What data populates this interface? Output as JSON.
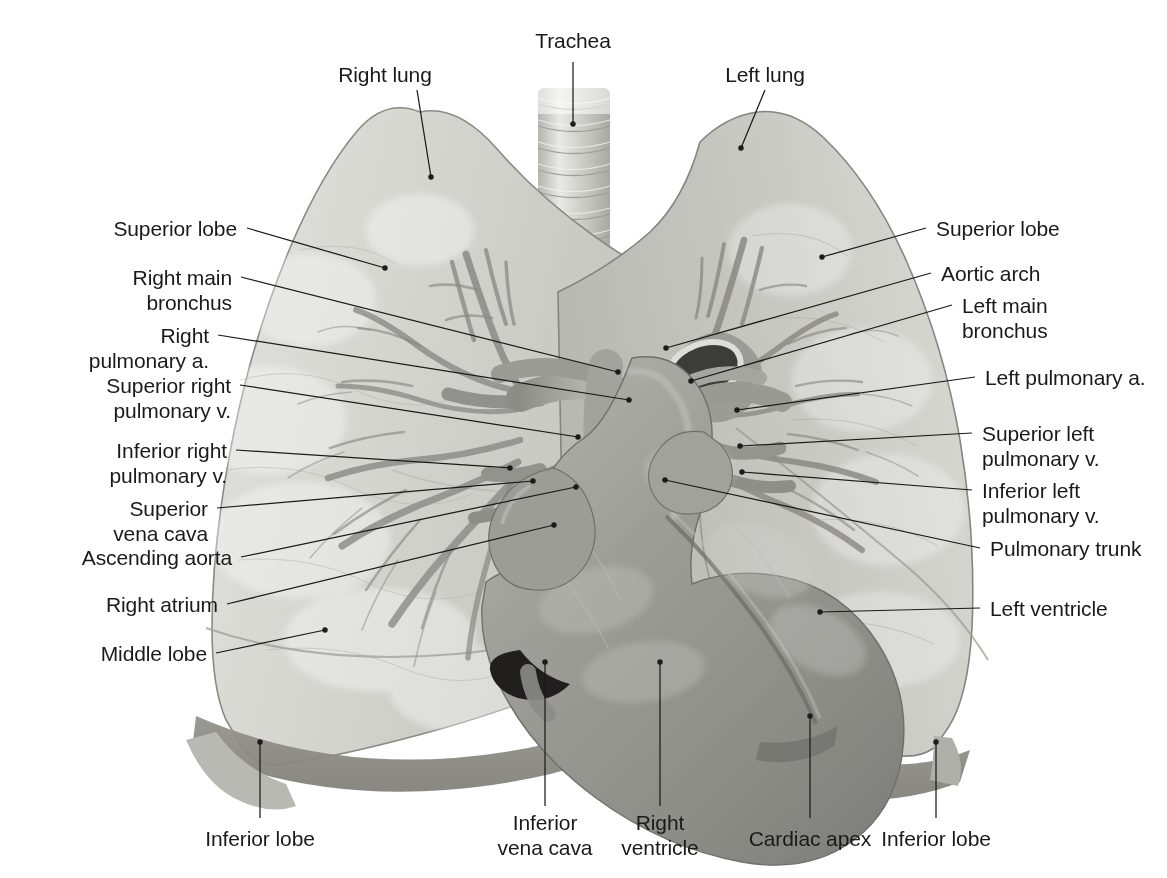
{
  "figure": {
    "background_color": "#ffffff",
    "text_color": "#1a1a1a",
    "leader_line_color": "#1a1a1a"
  },
  "labels": {
    "trachea": "Trachea",
    "right_lung": "Right lung",
    "left_lung": "Left lung",
    "superior_lobe_right": "Superior lobe",
    "right_main_bronchus_l1": "Right main",
    "right_main_bronchus_l2": "bronchus",
    "right_pulmonary_a_l1": "Right",
    "right_pulmonary_a_l2": "pulmonary a.",
    "superior_right_pulmonary_v_l1": "Superior right",
    "superior_right_pulmonary_v_l2": "pulmonary v.",
    "inferior_right_pulmonary_v_l1": "Inferior right",
    "inferior_right_pulmonary_v_l2": "pulmonary v.",
    "superior_vena_cava_l1": "Superior",
    "superior_vena_cava_l2": "vena cava",
    "ascending_aorta": "Ascending aorta",
    "right_atrium": "Right atrium",
    "middle_lobe": "Middle lobe",
    "superior_lobe_left": "Superior lobe",
    "aortic_arch": "Aortic arch",
    "left_main_bronchus_l1": "Left main",
    "left_main_bronchus_l2": "bronchus",
    "left_pulmonary_a": "Left pulmonary a.",
    "superior_left_pulmonary_v_l1": "Superior left",
    "superior_left_pulmonary_v_l2": "pulmonary v.",
    "inferior_left_pulmonary_v_l1": "Inferior left",
    "inferior_left_pulmonary_v_l2": "pulmonary v.",
    "pulmonary_trunk": "Pulmonary trunk",
    "left_ventricle": "Left ventricle",
    "inferior_lobe_right": "Inferior lobe",
    "inferior_vena_cava_l1": "Inferior",
    "inferior_vena_cava_l2": "vena cava",
    "right_ventricle_l1": "Right",
    "right_ventricle_l2": "ventricle",
    "cardiac_apex": "Cardiac apex",
    "inferior_lobe_left": "Inferior lobe"
  },
  "structures": [
    {
      "name": "trachea",
      "tone": "#cfcfcb"
    },
    {
      "name": "right-lung",
      "tone": "#d6d6d2"
    },
    {
      "name": "left-lung",
      "tone": "#cfcfca"
    },
    {
      "name": "heart",
      "tone": "#9a9a96"
    },
    {
      "name": "bronchial-tree",
      "tone": "#8e8e8a"
    },
    {
      "name": "great-vessels",
      "tone": "#a5a5a1"
    },
    {
      "name": "diaphragm-shadow",
      "tone": "#8c8c88"
    }
  ]
}
